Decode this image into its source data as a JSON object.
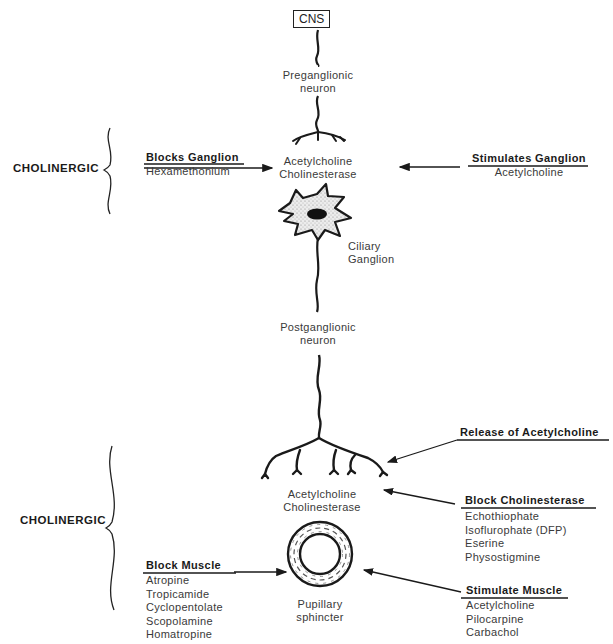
{
  "diagram": {
    "type": "pharmacology pathway diagram",
    "top_node": "CNS",
    "preganglionic": [
      "Preganglionic",
      "neuron"
    ],
    "ganglion_synapse": [
      "Acetylcholine",
      "Cholinesterase"
    ],
    "ganglion_label": [
      "Ciliary",
      "Ganglion"
    ],
    "postganglionic": [
      "Postganglionic",
      "neuron"
    ],
    "terminal_synapse": [
      "Acetylcholine",
      "Cholinesterase"
    ],
    "effector": [
      "Pupillary",
      "sphincter"
    ],
    "sections": [
      {
        "label": "CHOLINERGIC",
        "position": "upper"
      },
      {
        "label": "CHOLINERGIC",
        "position": "lower"
      }
    ],
    "blocks_ganglion": {
      "heading": "Blocks Ganglion",
      "drugs": [
        "Hexamethonium"
      ]
    },
    "stimulates_ganglion": {
      "heading": "Stimulates Ganglion",
      "drugs": [
        "Acetylcholine"
      ]
    },
    "release": {
      "heading": "Release of Acetylcholine"
    },
    "block_cholinesterase": {
      "heading": "Block Cholinesterase",
      "drugs": [
        "Echothiophate",
        "Isoflurophate (DFP)",
        "Eserine",
        "Physostigmine"
      ]
    },
    "block_muscle": {
      "heading": "Block Muscle",
      "drugs": [
        "Atropine",
        "Tropicamide",
        "Cyclopentolate",
        "Scopolamine",
        "Homatropine"
      ]
    },
    "stimulate_muscle": {
      "heading": "Stimulate Muscle",
      "drugs": [
        "Acetylcholine",
        "Pilocarpine",
        "Carbachol"
      ]
    },
    "colors": {
      "ink": "#1a1a1a",
      "text": "#3a3a3a",
      "background": "#ffffff",
      "cell_fill": "#d8d8d8"
    }
  }
}
